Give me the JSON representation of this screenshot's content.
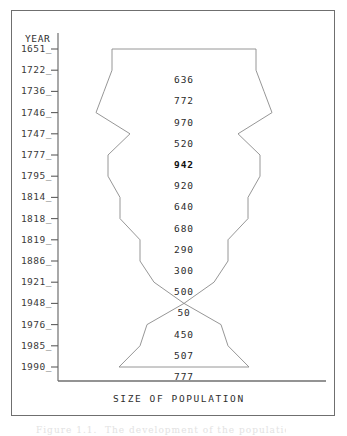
{
  "figure": {
    "axis_header": "YEAR",
    "x_axis_title": "SIZE OF POPULATION",
    "caption_partial": "Figure 1.1.  The development of the population",
    "line_color": "#8a8a8a",
    "axis_color": "#6f6f6f",
    "frame_color": "#6f6f6f",
    "text_color": "#2e2e2e",
    "background": "#ffffff"
  },
  "chart_data": {
    "type": "area",
    "title": "",
    "subtitle": "",
    "xlabel": "SIZE OF POPULATION",
    "ylabel": "YEAR",
    "orientation": "horizontal-symmetric",
    "grid": false,
    "legend": "none",
    "axis_ranges": {
      "x": [
        0,
        1000
      ],
      "y_categories_top_to_bottom": true
    },
    "categories": [
      "1651",
      "1722",
      "1736",
      "1746",
      "1747",
      "1777",
      "1795",
      "1814",
      "1818",
      "1819",
      "1886",
      "1921",
      "1948",
      "1976",
      "1985",
      "1990"
    ],
    "values": [
      null,
      636,
      772,
      970,
      520,
      942,
      920,
      640,
      680,
      290,
      300,
      500,
      50,
      450,
      507,
      777
    ],
    "value_labels": [
      "",
      "636",
      "772",
      "970",
      "520",
      "942",
      "920",
      "640",
      "680",
      "290",
      "300",
      "500",
      "50",
      "450",
      "507",
      "777"
    ],
    "bold_value_labels": [
      "942"
    ]
  },
  "rows": [
    {
      "year": "1651",
      "value": "",
      "half_width_px": 72
    },
    {
      "year": "1722",
      "value": "636",
      "half_width_px": 72
    },
    {
      "year": "1736",
      "value": "772",
      "half_width_px": 80
    },
    {
      "year": "1746",
      "value": "970",
      "half_width_px": 88
    },
    {
      "year": "1747",
      "value": "520",
      "half_width_px": 54
    },
    {
      "year": "1777",
      "value": "942",
      "half_width_px": 76
    },
    {
      "year": "1795",
      "value": "920",
      "half_width_px": 76
    },
    {
      "year": "1814",
      "value": "640",
      "half_width_px": 64
    },
    {
      "year": "1818",
      "value": "680",
      "half_width_px": 64
    },
    {
      "year": "1819",
      "value": "290",
      "half_width_px": 44
    },
    {
      "year": "1886",
      "value": "300",
      "half_width_px": 44
    },
    {
      "year": "1921",
      "value": "500",
      "half_width_px": 30
    },
    {
      "year": "1948",
      "value": "50",
      "half_width_px": 0
    },
    {
      "year": "1976",
      "value": "450",
      "half_width_px": 37
    },
    {
      "year": "1985",
      "value": "507",
      "half_width_px": 44
    },
    {
      "year": "1990",
      "value": "777",
      "half_width_px": 65
    }
  ]
}
